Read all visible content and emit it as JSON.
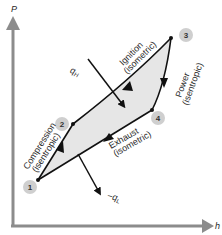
{
  "diagram": {
    "axes": {
      "y_label": "P",
      "x_label": "h",
      "color": "#8c8c8c"
    },
    "points": [
      {
        "id": "1",
        "label": "1"
      },
      {
        "id": "2",
        "label": "2"
      },
      {
        "id": "3",
        "label": "3"
      },
      {
        "id": "4",
        "label": "4"
      }
    ],
    "processes": [
      {
        "name": "Compression",
        "type": "(isentropic)"
      },
      {
        "name": "Ignition",
        "type": "(isometric)"
      },
      {
        "name": "Power",
        "type": "(isentropic)"
      },
      {
        "name": "Exhaust",
        "type": "(isometric)"
      }
    ],
    "heat": {
      "in_label": "q",
      "in_sub": "H",
      "out_label": "−q",
      "out_sub": "L"
    },
    "colors": {
      "fill": "#e6e6e6",
      "point_badge": "#cfcfcf",
      "line": "#111111"
    }
  }
}
